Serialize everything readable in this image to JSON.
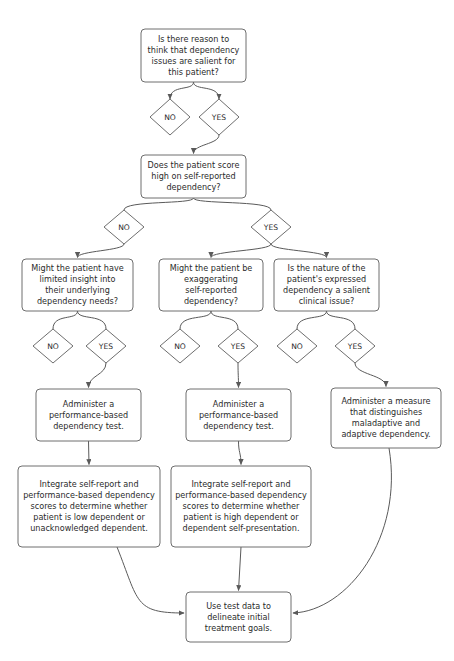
{
  "diagram": {
    "type": "flowchart",
    "orientation": "top-down",
    "background_color": "#ffffff",
    "box_stroke_color": "#6e6e6e",
    "edge_color": "#5a5a5a",
    "text_color": "#2b2b2b",
    "nodes": [
      {
        "id": "q1",
        "shape": "rounded-rect",
        "x": 141,
        "y": 29,
        "w": 105,
        "h": 53,
        "lines": [
          "Is there reason to",
          "think that dependency",
          "issues are salient for",
          "this patient?"
        ]
      },
      {
        "id": "q1-no",
        "shape": "diamond",
        "cx": 170,
        "cy": 117,
        "rx": 20,
        "ry": 18,
        "label": "NO"
      },
      {
        "id": "q1-yes",
        "shape": "diamond",
        "cx": 219,
        "cy": 117,
        "rx": 20,
        "ry": 18,
        "label": "YES"
      },
      {
        "id": "q2",
        "shape": "rounded-rect",
        "x": 141,
        "y": 155,
        "w": 105,
        "h": 43,
        "lines": [
          "Does the patient score",
          "high on self-reported",
          "dependency?"
        ]
      },
      {
        "id": "q2-no",
        "shape": "diamond",
        "cx": 124,
        "cy": 227,
        "rx": 20,
        "ry": 17,
        "label": "NO"
      },
      {
        "id": "q2-yes",
        "shape": "diamond",
        "cx": 271,
        "cy": 227,
        "rx": 20,
        "ry": 17,
        "label": "YES"
      },
      {
        "id": "q3a",
        "shape": "rounded-rect",
        "x": 22,
        "y": 259,
        "w": 111,
        "h": 52,
        "lines": [
          "Might the patient have",
          "limited insight into",
          "their underlying",
          "dependency needs?"
        ]
      },
      {
        "id": "q3b",
        "shape": "rounded-rect",
        "x": 159,
        "y": 259,
        "w": 104,
        "h": 52,
        "lines": [
          "Might the patient be",
          "exaggerating",
          "self-reported",
          "dependency?"
        ]
      },
      {
        "id": "q3c",
        "shape": "rounded-rect",
        "x": 274,
        "y": 259,
        "w": 105,
        "h": 52,
        "lines": [
          "Is the nature of the",
          "patient's expressed",
          "dependency a salient",
          "clinical issue?"
        ]
      },
      {
        "id": "q3a-no",
        "shape": "diamond",
        "cx": 53,
        "cy": 346,
        "rx": 20,
        "ry": 17,
        "label": "NO"
      },
      {
        "id": "q3a-yes",
        "shape": "diamond",
        "cx": 106,
        "cy": 346,
        "rx": 20,
        "ry": 17,
        "label": "YES"
      },
      {
        "id": "q3b-no",
        "shape": "diamond",
        "cx": 180,
        "cy": 346,
        "rx": 20,
        "ry": 17,
        "label": "NO"
      },
      {
        "id": "q3b-yes",
        "shape": "diamond",
        "cx": 238,
        "cy": 346,
        "rx": 20,
        "ry": 17,
        "label": "YES"
      },
      {
        "id": "q3c-no",
        "shape": "diamond",
        "cx": 297,
        "cy": 346,
        "rx": 20,
        "ry": 17,
        "label": "NO"
      },
      {
        "id": "q3c-yes",
        "shape": "diamond",
        "cx": 355,
        "cy": 346,
        "rx": 20,
        "ry": 17,
        "label": "YES"
      },
      {
        "id": "action-a",
        "shape": "rounded-rect",
        "x": 36,
        "y": 389,
        "w": 105,
        "h": 52,
        "lines": [
          "Administer a",
          "performance-based",
          "dependency test."
        ]
      },
      {
        "id": "action-b",
        "shape": "rounded-rect",
        "x": 186,
        "y": 389,
        "w": 105,
        "h": 52,
        "lines": [
          "Administer a",
          "performance-based",
          "dependency test."
        ]
      },
      {
        "id": "action-c",
        "shape": "rounded-rect",
        "x": 331,
        "y": 388,
        "w": 110,
        "h": 60,
        "lines": [
          "Administer a measure",
          "that distinguishes",
          "maladaptive and",
          "adaptive dependency."
        ]
      },
      {
        "id": "integrate-a",
        "shape": "rounded-rect",
        "x": 18,
        "y": 466,
        "w": 142,
        "h": 81,
        "lines": [
          "Integrate self-report and",
          "performance-based dependency",
          "scores to determine whether",
          "patient is low dependent or",
          "unacknowledged dependent."
        ]
      },
      {
        "id": "integrate-b",
        "shape": "rounded-rect",
        "x": 171,
        "y": 466,
        "w": 140,
        "h": 81,
        "lines": [
          "Integrate self-report and",
          "performance-based dependency",
          "scores to determine whether",
          "patient is high dependent or",
          "dependent self-presentation."
        ]
      },
      {
        "id": "final",
        "shape": "rounded-rect",
        "x": 186,
        "y": 592,
        "w": 105,
        "h": 50,
        "lines": [
          "Use test data to",
          "delineate initial",
          "treatment goals."
        ]
      }
    ],
    "edges": [
      {
        "id": "e-q1-no",
        "from": "q1",
        "to": "q1-no",
        "arrow": true
      },
      {
        "id": "e-q1-yes",
        "from": "q1",
        "to": "q1-yes",
        "arrow": true
      },
      {
        "id": "e-yes-q2",
        "from": "q1-yes",
        "to": "q2",
        "arrow": true
      },
      {
        "id": "e-q2-no",
        "from": "q2",
        "to": "q2-no",
        "arrow": false
      },
      {
        "id": "e-q2-yes",
        "from": "q2",
        "to": "q2-yes",
        "arrow": false
      },
      {
        "id": "e-no-q3a",
        "from": "q2-no",
        "to": "q3a",
        "arrow": true
      },
      {
        "id": "e-yes-q3b",
        "from": "q2-yes",
        "to": "q3b",
        "arrow": true
      },
      {
        "id": "e-yes-q3c",
        "from": "q2-yes",
        "to": "q3c",
        "arrow": true
      },
      {
        "id": "e-q3a-no",
        "from": "q3a",
        "to": "q3a-no",
        "arrow": false
      },
      {
        "id": "e-q3a-yes",
        "from": "q3a",
        "to": "q3a-yes",
        "arrow": false
      },
      {
        "id": "e-q3b-no",
        "from": "q3b",
        "to": "q3b-no",
        "arrow": false
      },
      {
        "id": "e-q3b-yes",
        "from": "q3b",
        "to": "q3b-yes",
        "arrow": false
      },
      {
        "id": "e-q3c-no",
        "from": "q3c",
        "to": "q3c-no",
        "arrow": false
      },
      {
        "id": "e-q3c-yes",
        "from": "q3c",
        "to": "q3c-yes",
        "arrow": false
      },
      {
        "id": "e-ya-act",
        "from": "q3a-yes",
        "to": "action-a",
        "arrow": true
      },
      {
        "id": "e-yb-act",
        "from": "q3b-yes",
        "to": "action-b",
        "arrow": true
      },
      {
        "id": "e-yc-act",
        "from": "q3c-yes",
        "to": "action-c",
        "arrow": true
      },
      {
        "id": "e-acta-int",
        "from": "action-a",
        "to": "integrate-a",
        "arrow": true
      },
      {
        "id": "e-actb-int",
        "from": "action-b",
        "to": "integrate-b",
        "arrow": true
      },
      {
        "id": "e-inta-fin",
        "from": "integrate-a",
        "to": "final",
        "arrow": true
      },
      {
        "id": "e-intb-fin",
        "from": "integrate-b",
        "to": "final",
        "arrow": true
      },
      {
        "id": "e-actc-fin",
        "from": "action-c",
        "to": "final",
        "arrow": true
      }
    ]
  }
}
